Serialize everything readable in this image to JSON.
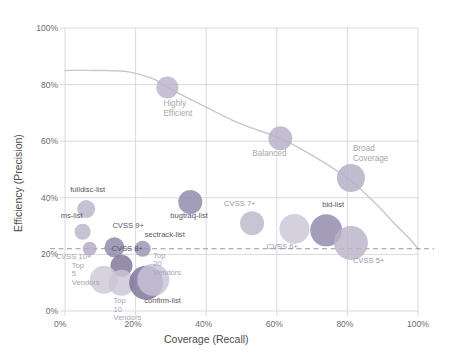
{
  "chart_data": {
    "type": "scatter",
    "title": "",
    "xlabel": "Coverage (Recall)",
    "ylabel": "Efficiency (Precision)",
    "xlim": [
      0,
      100
    ],
    "ylim": [
      0,
      100
    ],
    "xticks": [
      "0%",
      "20%",
      "40%",
      "60%",
      "80%",
      "100%"
    ],
    "xtick_values": [
      0,
      20,
      40,
      60,
      80,
      100
    ],
    "yticks": [
      "0%",
      "20%",
      "40%",
      "60%",
      "80%",
      "100%"
    ],
    "ytick_values": [
      0,
      20,
      40,
      60,
      80,
      100
    ],
    "grid": true,
    "legend": "none",
    "threshold_line": {
      "y": 22,
      "style": "dashed",
      "label": ""
    },
    "frontier_curve": {
      "name": "efficiency frontier",
      "points": [
        [
          0,
          85
        ],
        [
          10,
          85
        ],
        [
          18,
          84.5
        ],
        [
          25,
          82
        ],
        [
          29,
          79
        ],
        [
          40,
          72
        ],
        [
          50,
          66
        ],
        [
          61,
          61
        ],
        [
          70,
          55
        ],
        [
          80,
          47
        ],
        [
          88,
          38
        ],
        [
          94,
          30
        ],
        [
          98,
          25
        ],
        [
          100,
          22
        ]
      ]
    },
    "points": [
      {
        "label": "fulldisc-list",
        "x": 6,
        "y": 36,
        "size": 9,
        "color": "#b9b3c9",
        "label_dx": -16,
        "label_dy": -14
      },
      {
        "label": "ms-list",
        "x": 5,
        "y": 28,
        "size": 8,
        "color": "#b9b3c9",
        "label_dx": -22,
        "label_dy": -12
      },
      {
        "label": "CVSS 10+",
        "x": 7,
        "y": 22,
        "size": 7,
        "color": "#b2aac4",
        "label_dx": -34,
        "label_dy": 3
      },
      {
        "label": "CVSS 9+",
        "x": 14,
        "y": 22.5,
        "size": 10,
        "color": "#8d86a6",
        "label_dx": -2,
        "label_dy": -15
      },
      {
        "label": "CVSS 8+",
        "x": 16,
        "y": 16,
        "size": 11,
        "color": "#7d7598",
        "label_dx": -10,
        "label_dy": -10
      },
      {
        "label": "Top 5 Vendors",
        "x": 11,
        "y": 11,
        "size": 14,
        "color": "#cdc9d8",
        "label_dx": -32,
        "label_dy": -4
      },
      {
        "label": "Top 10 Vendors",
        "x": 16,
        "y": 10,
        "size": 13,
        "color": "#cbc6d7",
        "label_dx": -8,
        "label_dy": 12
      },
      {
        "label": "confirm-list",
        "x": 23,
        "y": 10,
        "size": 17,
        "color": "#7a7297",
        "label_dx": -2,
        "label_dy": 11
      },
      {
        "label": "Top 20 Vendors",
        "x": 25,
        "y": 11,
        "size": 16,
        "color": "#c8c3d5",
        "label_dx": 0,
        "label_dy": -12
      },
      {
        "label": "sectrack-list",
        "x": 22,
        "y": 22,
        "size": 8,
        "color": "#9b93b2",
        "label_dx": 2,
        "label_dy": -10
      },
      {
        "label": "bugtraq-list",
        "x": 35.5,
        "y": 38.5,
        "size": 12,
        "color": "#8e87a8",
        "label_dx": -20,
        "label_dy": 8
      },
      {
        "label": "Highly Efficient",
        "x": 29,
        "y": 79,
        "size": 11,
        "color": "#b9b3c9",
        "label_dx": -4,
        "label_dy": 9,
        "annotation": true
      },
      {
        "label": "Balanced",
        "x": 61,
        "y": 61,
        "size": 12,
        "color": "#b6b0c6",
        "label_dx": -28,
        "label_dy": 8,
        "annotation": true
      },
      {
        "label": "Broad Coverage",
        "x": 81,
        "y": 47,
        "size": 14,
        "color": "#b3adc4",
        "label_dx": 2,
        "label_dy": -20,
        "annotation": true
      },
      {
        "label": "CVSS 7+",
        "x": 53,
        "y": 31,
        "size": 12,
        "color": "#bdb7cb",
        "label_dx": -28,
        "label_dy": -11
      },
      {
        "label": "CVSS 6+",
        "x": 65,
        "y": 29,
        "size": 15,
        "color": "#cbc6d7",
        "label_dx": -28,
        "label_dy": 11
      },
      {
        "label": "bid-list",
        "x": 74,
        "y": 28.5,
        "size": 16,
        "color": "#8f87a9",
        "label_dx": -4,
        "label_dy": -13
      },
      {
        "label": "CVSS 5+",
        "x": 81,
        "y": 24,
        "size": 17,
        "color": "#b9b3c9",
        "label_dx": 2,
        "label_dy": 10
      }
    ],
    "colors": {
      "grid": "#d6d6d6",
      "axis_text": "#6b6b6b",
      "curve": "#c9c6d2",
      "threshold": "#a09aaf",
      "annotation_text": "#a8a8a8",
      "label_dark": "#5a5468",
      "label_light": "#a9a4b5"
    }
  }
}
